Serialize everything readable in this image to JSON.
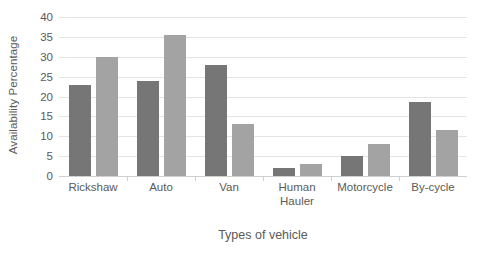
{
  "chart_data": {
    "type": "bar",
    "title": "",
    "xlabel": "Types of vehicle",
    "ylabel": "Availability Percentage",
    "categories": [
      "Rickshaw",
      "Auto",
      "Van",
      "Human Hauler",
      "Motorcycle",
      "By-cycle"
    ],
    "series": [
      {
        "name": "Series 1",
        "color": "#767676",
        "values": [
          23,
          24,
          28,
          2,
          5,
          18.5
        ]
      },
      {
        "name": "Series 2",
        "color": "#a3a3a3",
        "values": [
          30,
          35.5,
          13,
          3,
          8,
          11.5
        ]
      }
    ],
    "ylim": [
      0,
      40
    ],
    "ytick_labels": [
      "0",
      "5",
      "10",
      "15",
      "20",
      "25",
      "30",
      "35",
      "40"
    ],
    "ytick_values": [
      0,
      5,
      10,
      15,
      20,
      25,
      30,
      35,
      40
    ],
    "ytick_step": 5,
    "grid": true,
    "grid_axis": "y",
    "legend": false,
    "legend_position": "none",
    "grid_color": "#e4e4e4",
    "axis_color": "#d0d0d0",
    "text_color": "#5a5a5a",
    "background_color": "#ffffff",
    "category_label_lines": [
      [
        "Rickshaw"
      ],
      [
        "Auto"
      ],
      [
        "Van"
      ],
      [
        "Human",
        "Hauler"
      ],
      [
        "Motorcycle"
      ],
      [
        "By-cycle"
      ]
    ]
  }
}
